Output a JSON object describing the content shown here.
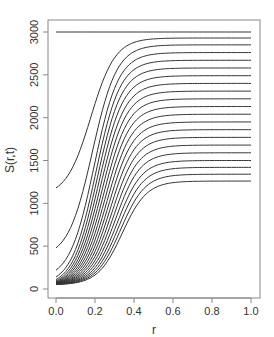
{
  "chart_data": {
    "type": "line",
    "title": "",
    "xlabel": "r",
    "ylabel": "S(r,t)",
    "xlim": [
      0,
      1
    ],
    "ylim": [
      0,
      3000
    ],
    "x_ticks": [
      "0.0",
      "0.2",
      "0.4",
      "0.6",
      "0.8",
      "1.0"
    ],
    "y_ticks": [
      "0",
      "500",
      "1000",
      "1500",
      "2000",
      "2500",
      "3000"
    ],
    "grid": false,
    "legend": "none",
    "line_color": "#333333",
    "series_description": "Family of sigmoid curves S(r,t) for successive t; each rises from a low start value at r=0 to a plateau by r~0.6",
    "series": [
      {
        "name": "t0",
        "start": 3000,
        "plateau": 3000
      },
      {
        "name": "t1",
        "start": 1180,
        "plateau": 2930
      },
      {
        "name": "t2",
        "start": 480,
        "plateau": 2850
      },
      {
        "name": "t3",
        "start": 220,
        "plateau": 2760
      },
      {
        "name": "t4",
        "start": 140,
        "plateau": 2670
      },
      {
        "name": "t5",
        "start": 110,
        "plateau": 2580
      },
      {
        "name": "t6",
        "start": 95,
        "plateau": 2490
      },
      {
        "name": "t7",
        "start": 85,
        "plateau": 2400
      },
      {
        "name": "t8",
        "start": 80,
        "plateau": 2310
      },
      {
        "name": "t9",
        "start": 75,
        "plateau": 2220
      },
      {
        "name": "t10",
        "start": 72,
        "plateau": 2130
      },
      {
        "name": "t11",
        "start": 70,
        "plateau": 2040
      },
      {
        "name": "t12",
        "start": 68,
        "plateau": 1950
      },
      {
        "name": "t13",
        "start": 66,
        "plateau": 1860
      },
      {
        "name": "t14",
        "start": 64,
        "plateau": 1770
      },
      {
        "name": "t15",
        "start": 62,
        "plateau": 1680
      },
      {
        "name": "t16",
        "start": 60,
        "plateau": 1590
      },
      {
        "name": "t17",
        "start": 58,
        "plateau": 1500
      },
      {
        "name": "t18",
        "start": 56,
        "plateau": 1420
      },
      {
        "name": "t19",
        "start": 54,
        "plateau": 1340
      },
      {
        "name": "t20",
        "start": 52,
        "plateau": 1260
      }
    ]
  }
}
